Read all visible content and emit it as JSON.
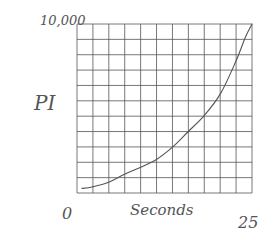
{
  "chart_data": {
    "type": "line",
    "title": "",
    "xlabel": "Seconds",
    "ylabel": "PI",
    "x_tick_labels": [
      "0",
      "25"
    ],
    "y_tick_labels": [
      "10,000"
    ],
    "xlim": [
      0,
      25
    ],
    "ylim": [
      0,
      10000
    ],
    "grid": true,
    "grid_cells": {
      "columns": 11,
      "rows": 11
    },
    "series": [
      {
        "name": "curve",
        "x": [
          0.7,
          2.3,
          4.6,
          6.8,
          9.1,
          11.4,
          13.6,
          15.9,
          18.2,
          20.5,
          22.7,
          24.1,
          25
        ],
        "y": [
          270,
          370,
          650,
          1110,
          1520,
          2000,
          2700,
          3640,
          4600,
          5880,
          7800,
          9260,
          10000
        ]
      }
    ]
  },
  "labels": {
    "y_max": "10,000",
    "y_axis": "PI",
    "x_min": "0",
    "x_axis": "Seconds",
    "x_max": "25"
  },
  "colors": {
    "grid": "#555555",
    "curve": "#555555",
    "text": "#555555",
    "background": "#ffffff"
  }
}
